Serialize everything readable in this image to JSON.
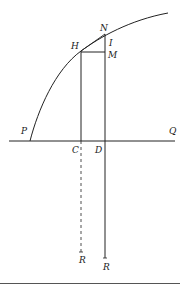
{
  "figure": {
    "type": "geometric-construction",
    "colors": {
      "stroke": "#222222",
      "background": "#ffffff",
      "rule": "#555555"
    },
    "labels": {
      "P": "P",
      "Q": "Q",
      "H": "H",
      "N": "N",
      "I": "I",
      "M": "M",
      "C": "C",
      "D": "D",
      "R_dashed": "R",
      "R_solid": "R"
    },
    "elements": [
      "curve PHN",
      "horizontal line PQ",
      "vertical HC (solid above PQ, dashed below to R)",
      "vertical ND extended to R",
      "horizontal HM",
      "chord HN"
    ]
  }
}
